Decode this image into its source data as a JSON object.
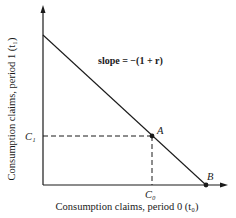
{
  "diagram": {
    "type": "intertemporal budget line",
    "y_axis_label": "Consumption claims, period 1 (t₁)",
    "x_axis_label": "Consumption claims, period 0 (t₀)",
    "slope_annotation": "slope = −(1 + r)",
    "points": [
      {
        "id": "A",
        "label": "A"
      },
      {
        "id": "B",
        "label": "B"
      }
    ],
    "tick_labels": {
      "y": "C₁",
      "x": "C₀"
    },
    "colors": {
      "line": "#1a1a1a",
      "background": "#ffffff"
    }
  }
}
